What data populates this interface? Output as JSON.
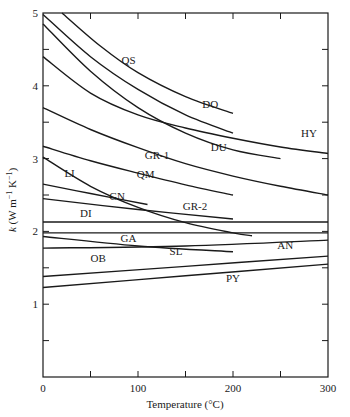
{
  "chart_data": {
    "type": "line",
    "title": "",
    "xlabel": "Temperature (°C)",
    "ylabel": "k (W m⁻¹ K⁻¹)",
    "xlim": [
      0,
      300
    ],
    "ylim": [
      0,
      5
    ],
    "x_ticks": [
      0,
      100,
      200,
      300
    ],
    "x_minor_ticks": [
      50,
      150,
      250
    ],
    "y_ticks": [
      1,
      2,
      3,
      4,
      5
    ],
    "y_minor_ticks": [
      0.5,
      1.5,
      2.5,
      3.5,
      4.5
    ],
    "grid": false,
    "legend": "inline labels",
    "series": [
      {
        "name": "QS",
        "points": [
          [
            20,
            5.0
          ],
          [
            60,
            4.55
          ],
          [
            100,
            4.18
          ],
          [
            150,
            3.85
          ],
          [
            200,
            3.62
          ]
        ],
        "label_pos": [
          90,
          4.3
        ]
      },
      {
        "name": "DO",
        "points": [
          [
            0,
            4.98
          ],
          [
            50,
            4.4
          ],
          [
            100,
            3.95
          ],
          [
            150,
            3.6
          ],
          [
            200,
            3.35
          ]
        ],
        "label_pos": [
          176,
          3.7
        ]
      },
      {
        "name": "DU",
        "points": [
          [
            0,
            4.85
          ],
          [
            50,
            4.2
          ],
          [
            100,
            3.7
          ],
          [
            150,
            3.35
          ],
          [
            200,
            3.12
          ],
          [
            250,
            3.0
          ]
        ],
        "label_pos": [
          185,
          3.1
        ]
      },
      {
        "name": "HY",
        "points": [
          [
            0,
            4.4
          ],
          [
            50,
            3.9
          ],
          [
            100,
            3.6
          ],
          [
            150,
            3.42
          ],
          [
            200,
            3.28
          ],
          [
            250,
            3.16
          ],
          [
            300,
            3.07
          ]
        ],
        "label_pos": [
          280,
          3.3
        ]
      },
      {
        "name": "GR-1",
        "points": [
          [
            0,
            3.7
          ],
          [
            50,
            3.4
          ],
          [
            100,
            3.15
          ],
          [
            150,
            2.93
          ],
          [
            200,
            2.76
          ],
          [
            250,
            2.62
          ],
          [
            300,
            2.5
          ]
        ],
        "label_pos": [
          120,
          3.0
        ]
      },
      {
        "name": "QM",
        "points": [
          [
            0,
            3.17
          ],
          [
            50,
            2.97
          ],
          [
            100,
            2.8
          ],
          [
            150,
            2.64
          ],
          [
            200,
            2.5
          ]
        ],
        "label_pos": [
          108,
          2.73
        ]
      },
      {
        "name": "LI",
        "points": [
          [
            0,
            3.02
          ],
          [
            50,
            2.62
          ],
          [
            100,
            2.33
          ],
          [
            150,
            2.12
          ],
          [
            200,
            1.98
          ],
          [
            220,
            1.94
          ]
        ],
        "label_pos": [
          28,
          2.75
        ]
      },
      {
        "name": "GN",
        "points": [
          [
            0,
            2.65
          ],
          [
            50,
            2.52
          ],
          [
            110,
            2.37
          ]
        ],
        "label_pos": [
          78,
          2.43
        ]
      },
      {
        "name": "GR-2",
        "points": [
          [
            0,
            2.45
          ],
          [
            100,
            2.3
          ],
          [
            200,
            2.17
          ]
        ],
        "label_pos": [
          160,
          2.3
        ]
      },
      {
        "name": "DI",
        "points": [
          [
            0,
            2.13
          ],
          [
            300,
            2.13
          ]
        ],
        "label_pos": [
          45,
          2.2
        ]
      },
      {
        "name": "GA",
        "points": [
          [
            0,
            1.98
          ],
          [
            300,
            1.98
          ]
        ],
        "label_pos": [
          90,
          1.86
        ]
      },
      {
        "name": "SL",
        "points": [
          [
            0,
            1.93
          ],
          [
            100,
            1.8
          ],
          [
            200,
            1.72
          ]
        ],
        "label_pos": [
          140,
          1.68
        ]
      },
      {
        "name": "AN",
        "points": [
          [
            0,
            1.77
          ],
          [
            150,
            1.8
          ],
          [
            300,
            1.88
          ]
        ],
        "label_pos": [
          255,
          1.76
        ]
      },
      {
        "name": "OB",
        "points": [
          [
            0,
            1.38
          ],
          [
            150,
            1.52
          ],
          [
            300,
            1.66
          ]
        ],
        "label_pos": [
          58,
          1.58
        ]
      },
      {
        "name": "PY",
        "points": [
          [
            0,
            1.23
          ],
          [
            150,
            1.39
          ],
          [
            300,
            1.55
          ]
        ],
        "label_pos": [
          200,
          1.3
        ]
      }
    ]
  },
  "axes": {
    "x_title": "Temperature (°C)",
    "y_title_k": "k",
    "y_title_rest": " (W m",
    "y_title_sup1": "−1",
    "y_title_mid": " K",
    "y_title_sup2": "−1",
    "y_title_close": ")"
  },
  "style": {
    "line_color": "#1a1a1a",
    "background": "#ffffff"
  }
}
